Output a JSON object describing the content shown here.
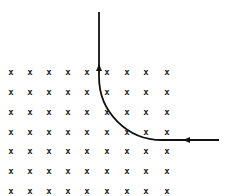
{
  "diagram": {
    "field": {
      "symbol": "x",
      "columns_x": [
        11,
        30,
        49,
        68,
        87,
        107,
        127,
        146,
        167
      ],
      "rows_y": [
        72,
        92,
        112,
        132,
        151,
        171,
        191
      ],
      "color": "#222222"
    },
    "path": {
      "color": "#111111",
      "entry": {
        "x": 219,
        "y": 140
      },
      "arc_start": {
        "x": 162,
        "y": 140
      },
      "arc_end": {
        "x": 99,
        "y": 77
      },
      "exit": {
        "x": 99,
        "y": 12
      },
      "arrows": [
        {
          "x": 188,
          "y": 140,
          "direction": "left"
        },
        {
          "x": 99,
          "y": 69,
          "direction": "up"
        }
      ]
    }
  }
}
